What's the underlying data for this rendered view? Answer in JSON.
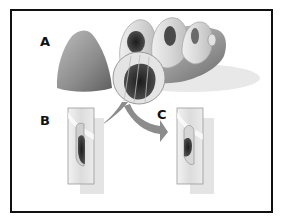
{
  "figure": {
    "labels": {
      "a": "A",
      "b": "B",
      "c": "C"
    },
    "colors": {
      "frame": "#111111",
      "tissue_light": "#d8d8d8",
      "tissue_mid": "#9a9a9a",
      "tissue_dark": "#6e6e6e",
      "lumen": "#2a2a2a",
      "arrow": "#8c8c8c",
      "shadow": "#e6e6e6"
    }
  }
}
